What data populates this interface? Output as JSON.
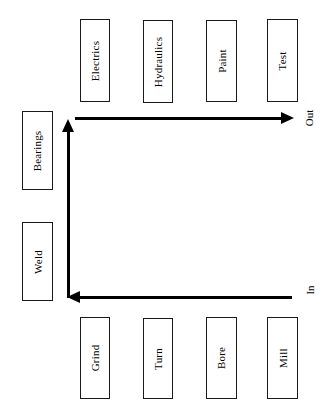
{
  "diagram": {
    "orientation": "rotated-90-ccw",
    "line_color": "#000000",
    "box_border_color": "#1a1a1a",
    "box_fill_color": "#ffffff",
    "background_color": "#ffffff",
    "top_row": {
      "name": "upper-station-row",
      "stations": [
        {
          "label": "Electrics",
          "x": 80,
          "y": 19,
          "w": 30,
          "h": 83
        },
        {
          "label": "Hydraulics",
          "x": 143,
          "y": 20,
          "w": 30,
          "h": 83
        },
        {
          "label": "Paint",
          "x": 206,
          "y": 20,
          "w": 31,
          "h": 82
        },
        {
          "label": "Test",
          "x": 267,
          "y": 19,
          "w": 31,
          "h": 83
        }
      ]
    },
    "left_column": {
      "name": "left-station-column",
      "stations": [
        {
          "label": "Bearings",
          "x": 22,
          "y": 111,
          "w": 31,
          "h": 79
        },
        {
          "label": "Weld",
          "x": 22,
          "y": 222,
          "w": 31,
          "h": 79
        }
      ]
    },
    "bottom_row": {
      "name": "lower-station-row",
      "stations": [
        {
          "label": "Grind",
          "x": 80,
          "y": 317,
          "w": 30,
          "h": 82
        },
        {
          "label": "Turn",
          "x": 143,
          "y": 318,
          "w": 30,
          "h": 81
        },
        {
          "label": "Bore",
          "x": 206,
          "y": 317,
          "w": 31,
          "h": 82
        },
        {
          "label": "Mill",
          "x": 267,
          "y": 317,
          "w": 31,
          "h": 82
        }
      ]
    },
    "flows": [
      {
        "name": "outbound-flow",
        "label": "Out",
        "direction": "right",
        "label_x": 305,
        "label_y": 126
      },
      {
        "name": "inbound-flow",
        "label": "In",
        "direction": "left",
        "label_x": 307,
        "label_y": 291
      },
      {
        "name": "vertical-transfer-flow",
        "label": "",
        "direction": "up"
      }
    ]
  }
}
